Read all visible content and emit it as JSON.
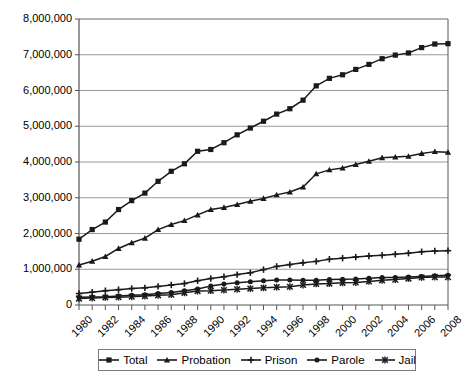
{
  "chart_data": {
    "type": "line",
    "title": "",
    "subtitle": "",
    "xlabel": "",
    "ylabel": "",
    "x": [
      1980,
      1981,
      1982,
      1983,
      1984,
      1985,
      1986,
      1987,
      1988,
      1989,
      1990,
      1991,
      1992,
      1993,
      1994,
      1995,
      1996,
      1997,
      1998,
      1999,
      2000,
      2001,
      2002,
      2003,
      2004,
      2005,
      2006,
      2007,
      2008
    ],
    "xlim": [
      1980,
      2008
    ],
    "ylim": [
      0,
      8000000
    ],
    "ytick_labels": [
      "8,000,000",
      "7,000,000",
      "6,000,000",
      "5,000,000",
      "4,000,000",
      "3,000,000",
      "2,000,000",
      "1,000,000",
      "0"
    ],
    "ytick_values": [
      8000000,
      7000000,
      6000000,
      5000000,
      4000000,
      3000000,
      2000000,
      1000000,
      0
    ],
    "xtick_labels": [
      "1980",
      "1982",
      "1984",
      "1986",
      "1988",
      "1990",
      "1992",
      "1994",
      "1996",
      "1998",
      "2000",
      "2002",
      "2004",
      "2006",
      "2008"
    ],
    "xtick_values": [
      1980,
      1982,
      1984,
      1986,
      1988,
      1990,
      1992,
      1994,
      1996,
      1998,
      2000,
      2002,
      2004,
      2006,
      2008
    ],
    "minor_xticks_every": 1,
    "grid": "horizontal",
    "legend_position": "bottom",
    "series": [
      {
        "name": "Total",
        "marker": "square",
        "color": "#1a1a1a",
        "values": [
          1840400,
          2110000,
          2320000,
          2670000,
          2920000,
          3130000,
          3460000,
          3740000,
          3950000,
          4300000,
          4350000,
          4540000,
          4760000,
          4950000,
          5140000,
          5340000,
          5490000,
          5730000,
          6130000,
          6340000,
          6440000,
          6590000,
          6730000,
          6890000,
          6990000,
          7050000,
          7200000,
          7300000,
          7310000
        ]
      },
      {
        "name": "Probation",
        "marker": "triangle",
        "color": "#1a1a1a",
        "values": [
          1118000,
          1225000,
          1357000,
          1582000,
          1740000,
          1870000,
          2110000,
          2250000,
          2360000,
          2520000,
          2670000,
          2730000,
          2810000,
          2900000,
          2980000,
          3080000,
          3160000,
          3300000,
          3670000,
          3780000,
          3830000,
          3930000,
          4020000,
          4120000,
          4140000,
          4160000,
          4240000,
          4290000,
          4270000
        ]
      },
      {
        "name": "Prison",
        "marker": "plus",
        "color": "#1a1a1a",
        "values": [
          320000,
          360000,
          400000,
          430000,
          460000,
          480000,
          520000,
          560000,
          600000,
          680000,
          740000,
          790000,
          850000,
          900000,
          990000,
          1080000,
          1130000,
          1180000,
          1220000,
          1280000,
          1310000,
          1340000,
          1370000,
          1390000,
          1420000,
          1450000,
          1490000,
          1510000,
          1520000
        ]
      },
      {
        "name": "Parole",
        "marker": "circle",
        "color": "#1a1a1a",
        "values": [
          220000,
          225000,
          230000,
          250000,
          270000,
          290000,
          320000,
          350000,
          400000,
          450000,
          530000,
          590000,
          620000,
          650000,
          680000,
          700000,
          700000,
          690000,
          690000,
          710000,
          720000,
          730000,
          750000,
          770000,
          770000,
          780000,
          800000,
          820000,
          830000
        ]
      },
      {
        "name": "Jail",
        "marker": "x",
        "color": "#1a1a1a",
        "values": [
          180000,
          195000,
          210000,
          220000,
          230000,
          250000,
          270000,
          290000,
          340000,
          390000,
          400000,
          420000,
          440000,
          460000,
          480000,
          500000,
          510000,
          560000,
          590000,
          600000,
          620000,
          630000,
          660000,
          690000,
          710000,
          740000,
          770000,
          780000,
          780000
        ]
      }
    ]
  },
  "legend": {
    "items": [
      {
        "label": "Total",
        "marker": "square"
      },
      {
        "label": "Probation",
        "marker": "triangle"
      },
      {
        "label": "Prison",
        "marker": "plus"
      },
      {
        "label": "Parole",
        "marker": "circle"
      },
      {
        "label": "Jail",
        "marker": "x"
      }
    ]
  }
}
